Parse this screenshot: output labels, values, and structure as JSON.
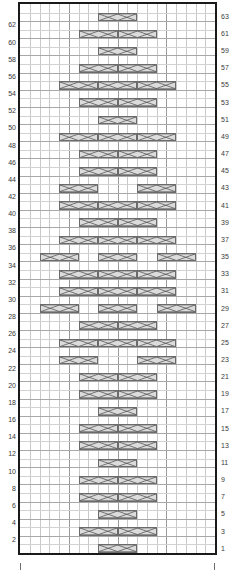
{
  "chart": {
    "type": "knitting-cable-chart",
    "columns": 20,
    "rows": 64,
    "row_numbering": {
      "left_side": "even",
      "right_side": "odd",
      "direction": "bottom-to-top"
    },
    "colors": {
      "grid_minor": "#c9c9c9",
      "grid_major": "#9a9a9a",
      "border": "#1a1a1a",
      "cable_fill": "#dcdcdc",
      "cable_stroke": "#6b6b6b",
      "label_text": "#3a3a3a"
    },
    "left_labels": [
      62,
      60,
      58,
      56,
      54,
      52,
      50,
      48,
      46,
      44,
      42,
      40,
      38,
      36,
      34,
      32,
      30,
      28,
      26,
      24,
      22,
      20,
      18,
      16,
      14,
      12,
      10,
      8,
      6,
      4,
      2
    ],
    "right_labels": [
      63,
      61,
      59,
      57,
      55,
      53,
      51,
      49,
      47,
      45,
      43,
      41,
      39,
      37,
      35,
      33,
      31,
      29,
      27,
      25,
      23,
      21,
      19,
      17,
      15,
      13,
      11,
      9,
      7,
      5,
      3,
      1
    ],
    "cables": [
      {
        "row": 63,
        "col": 8,
        "span": 4,
        "kind": "cross"
      },
      {
        "row": 61,
        "col": 6,
        "span": 4,
        "kind": "cross"
      },
      {
        "row": 61,
        "col": 10,
        "span": 4,
        "kind": "cross"
      },
      {
        "row": 59,
        "col": 8,
        "span": 4,
        "kind": "cross"
      },
      {
        "row": 57,
        "col": 6,
        "span": 4,
        "kind": "cross"
      },
      {
        "row": 57,
        "col": 10,
        "span": 4,
        "kind": "cross"
      },
      {
        "row": 55,
        "col": 4,
        "span": 4,
        "kind": "cross"
      },
      {
        "row": 55,
        "col": 8,
        "span": 4,
        "kind": "cross"
      },
      {
        "row": 55,
        "col": 12,
        "span": 4,
        "kind": "cross"
      },
      {
        "row": 53,
        "col": 6,
        "span": 4,
        "kind": "cross"
      },
      {
        "row": 53,
        "col": 10,
        "span": 4,
        "kind": "cross"
      },
      {
        "row": 51,
        "col": 8,
        "span": 4,
        "kind": "cross"
      },
      {
        "row": 49,
        "col": 4,
        "span": 4,
        "kind": "cross"
      },
      {
        "row": 49,
        "col": 8,
        "span": 4,
        "kind": "cross"
      },
      {
        "row": 49,
        "col": 12,
        "span": 4,
        "kind": "cross"
      },
      {
        "row": 47,
        "col": 6,
        "span": 4,
        "kind": "cross"
      },
      {
        "row": 47,
        "col": 10,
        "span": 4,
        "kind": "cross"
      },
      {
        "row": 45,
        "col": 6,
        "span": 4,
        "kind": "cross"
      },
      {
        "row": 45,
        "col": 10,
        "span": 4,
        "kind": "cross"
      },
      {
        "row": 43,
        "col": 4,
        "span": 4,
        "kind": "cross"
      },
      {
        "row": 43,
        "col": 12,
        "span": 4,
        "kind": "cross"
      },
      {
        "row": 41,
        "col": 4,
        "span": 4,
        "kind": "cross"
      },
      {
        "row": 41,
        "col": 8,
        "span": 4,
        "kind": "cross"
      },
      {
        "row": 41,
        "col": 12,
        "span": 4,
        "kind": "cross"
      },
      {
        "row": 39,
        "col": 6,
        "span": 4,
        "kind": "cross"
      },
      {
        "row": 39,
        "col": 10,
        "span": 4,
        "kind": "cross"
      },
      {
        "row": 37,
        "col": 4,
        "span": 4,
        "kind": "cross"
      },
      {
        "row": 37,
        "col": 8,
        "span": 4,
        "kind": "cross"
      },
      {
        "row": 37,
        "col": 12,
        "span": 4,
        "kind": "cross"
      },
      {
        "row": 35,
        "col": 2,
        "span": 4,
        "kind": "cross"
      },
      {
        "row": 35,
        "col": 8,
        "span": 4,
        "kind": "cross"
      },
      {
        "row": 35,
        "col": 14,
        "span": 4,
        "kind": "cross"
      },
      {
        "row": 33,
        "col": 4,
        "span": 4,
        "kind": "cross"
      },
      {
        "row": 33,
        "col": 8,
        "span": 4,
        "kind": "cross"
      },
      {
        "row": 33,
        "col": 12,
        "span": 4,
        "kind": "cross"
      },
      {
        "row": 31,
        "col": 4,
        "span": 4,
        "kind": "cross"
      },
      {
        "row": 31,
        "col": 8,
        "span": 4,
        "kind": "cross"
      },
      {
        "row": 31,
        "col": 12,
        "span": 4,
        "kind": "cross"
      },
      {
        "row": 29,
        "col": 2,
        "span": 4,
        "kind": "cross"
      },
      {
        "row": 29,
        "col": 8,
        "span": 4,
        "kind": "cross"
      },
      {
        "row": 29,
        "col": 14,
        "span": 4,
        "kind": "cross"
      },
      {
        "row": 27,
        "col": 6,
        "span": 4,
        "kind": "cross"
      },
      {
        "row": 27,
        "col": 10,
        "span": 4,
        "kind": "cross"
      },
      {
        "row": 25,
        "col": 4,
        "span": 4,
        "kind": "cross"
      },
      {
        "row": 25,
        "col": 8,
        "span": 4,
        "kind": "cross"
      },
      {
        "row": 25,
        "col": 12,
        "span": 4,
        "kind": "cross"
      },
      {
        "row": 23,
        "col": 4,
        "span": 4,
        "kind": "cross"
      },
      {
        "row": 23,
        "col": 12,
        "span": 4,
        "kind": "cross"
      },
      {
        "row": 21,
        "col": 6,
        "span": 4,
        "kind": "cross"
      },
      {
        "row": 21,
        "col": 10,
        "span": 4,
        "kind": "cross"
      },
      {
        "row": 19,
        "col": 6,
        "span": 4,
        "kind": "cross"
      },
      {
        "row": 19,
        "col": 10,
        "span": 4,
        "kind": "cross"
      },
      {
        "row": 17,
        "col": 8,
        "span": 4,
        "kind": "cross"
      },
      {
        "row": 15,
        "col": 6,
        "span": 4,
        "kind": "cross"
      },
      {
        "row": 15,
        "col": 10,
        "span": 4,
        "kind": "cross"
      },
      {
        "row": 13,
        "col": 6,
        "span": 4,
        "kind": "cross"
      },
      {
        "row": 13,
        "col": 10,
        "span": 4,
        "kind": "cross"
      },
      {
        "row": 11,
        "col": 8,
        "span": 4,
        "kind": "cross"
      },
      {
        "row": 9,
        "col": 6,
        "span": 4,
        "kind": "cross"
      },
      {
        "row": 9,
        "col": 10,
        "span": 4,
        "kind": "cross"
      },
      {
        "row": 7,
        "col": 6,
        "span": 4,
        "kind": "cross"
      },
      {
        "row": 7,
        "col": 10,
        "span": 4,
        "kind": "cross"
      },
      {
        "row": 5,
        "col": 8,
        "span": 4,
        "kind": "cross"
      },
      {
        "row": 3,
        "col": 6,
        "span": 4,
        "kind": "cross"
      },
      {
        "row": 3,
        "col": 10,
        "span": 4,
        "kind": "cross"
      },
      {
        "row": 1,
        "col": 8,
        "span": 4,
        "kind": "cross"
      }
    ],
    "edge_ticks": [
      {
        "side": "left"
      },
      {
        "side": "right"
      }
    ]
  }
}
